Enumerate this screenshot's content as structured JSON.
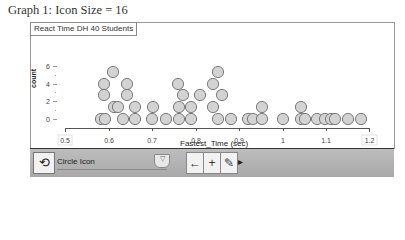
{
  "graph_title": "Graph 1: Icon Size = 16",
  "frame_title": "React Time DH 40 Students",
  "toolbar": {
    "refresh_icon": "refresh-icon",
    "icon_select_value": "Circle Icon",
    "dropdown_arrow": "▼",
    "slider_label": "▽",
    "left_arrow": "←",
    "plus": "+",
    "pencil": "✎",
    "more": "▸"
  },
  "chart_data": {
    "type": "scatter",
    "subtype": "dot plot",
    "title": "React Time DH 40 Students",
    "xlabel": "Fastest_Time (sec)",
    "ylabel": "count",
    "xlim": [
      0.5,
      1.2
    ],
    "ylim": [
      0,
      6
    ],
    "x_ticks": [
      "0.5",
      "0.6",
      "0.7",
      "0.8",
      "0.9",
      "1",
      "1.1",
      "1.2"
    ],
    "y_ticks": [
      "0",
      "2",
      "4",
      "6"
    ],
    "icon": "circle",
    "icon_size": 16,
    "n": 40,
    "values_sec": [
      0.584,
      0.593,
      0.6,
      0.6,
      0.6,
      0.608,
      0.61,
      0.61,
      0.634,
      0.634,
      0.634,
      0.634,
      0.64,
      0.66,
      0.66,
      0.7,
      0.7,
      0.706,
      0.735,
      0.762,
      0.762,
      0.768,
      0.775,
      0.79,
      0.79,
      0.81,
      0.845,
      0.845,
      0.848,
      0.857,
      0.857,
      0.885,
      0.923,
      0.935,
      0.955,
      0.955,
      1.005,
      1.045,
      1.05,
      1.065,
      1.095,
      1.11,
      1.14,
      1.17
    ],
    "series": [
      {
        "name": "Fastest_Time",
        "marker": "circle",
        "color": "#d3d3d3",
        "edge": "#707070"
      }
    ],
    "grid": false
  },
  "circles": [
    [
      101,
      119
    ],
    [
      105,
      119
    ],
    [
      123,
      119
    ],
    [
      135,
      119
    ],
    [
      152,
      119
    ],
    [
      166,
      119
    ],
    [
      179,
      119
    ],
    [
      191,
      119
    ],
    [
      218,
      119
    ],
    [
      231,
      119
    ],
    [
      248,
      119
    ],
    [
      253,
      119
    ],
    [
      262,
      119
    ],
    [
      283,
      119
    ],
    [
      301,
      119
    ],
    [
      305,
      119
    ],
    [
      317,
      119
    ],
    [
      325,
      119
    ],
    [
      331,
      119
    ],
    [
      335,
      119
    ],
    [
      348,
      119
    ],
    [
      361,
      119
    ],
    [
      114,
      107
    ],
    [
      118,
      107
    ],
    [
      135,
      107
    ],
    [
      153,
      107
    ],
    [
      179,
      107
    ],
    [
      191,
      107
    ],
    [
      213,
      107
    ],
    [
      262,
      107
    ],
    [
      301,
      107
    ],
    [
      104,
      95
    ],
    [
      127,
      95
    ],
    [
      183,
      95
    ],
    [
      200,
      95
    ],
    [
      222,
      95
    ],
    [
      104,
      84
    ],
    [
      127,
      84
    ],
    [
      178,
      84
    ],
    [
      213,
      84
    ],
    [
      113,
      72
    ],
    [
      218,
      72
    ]
  ],
  "colors": {
    "circle_fill": "#d3d3d3",
    "circle_stroke": "#6e6e6e",
    "toolbar_bg": "#b4b4b4",
    "axis": "#555555"
  }
}
